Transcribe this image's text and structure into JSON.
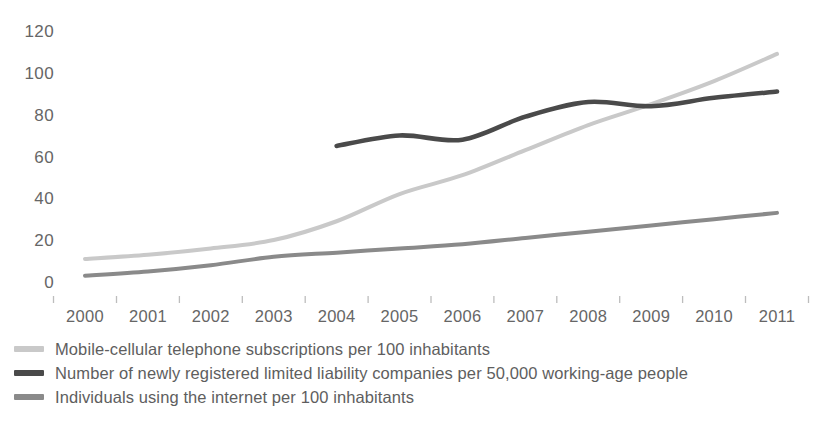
{
  "chart_data": {
    "type": "line",
    "title": "",
    "subtitle": "",
    "xlabel": "",
    "ylabel": "",
    "x": [
      2000,
      2001,
      2002,
      2003,
      2004,
      2005,
      2006,
      2007,
      2008,
      2009,
      2010,
      2011
    ],
    "categories": [
      "2000",
      "2001",
      "2002",
      "2003",
      "2004",
      "2005",
      "2006",
      "2007",
      "2008",
      "2009",
      "2010",
      "2011"
    ],
    "xlim": [
      2000,
      2011
    ],
    "ylim": [
      0,
      120
    ],
    "y_ticks": [
      0,
      20,
      40,
      60,
      80,
      100,
      120
    ],
    "y_tick_labels": [
      "0",
      "20",
      "40",
      "60",
      "80",
      "100",
      "120"
    ],
    "grid": false,
    "legend_position": "below",
    "series": [
      {
        "name": "Mobile-cellular telephone subscriptions per 100 inhabitants",
        "color": "#c9c9c9",
        "x": [
          2000,
          2001,
          2002,
          2003,
          2004,
          2005,
          2006,
          2007,
          2008,
          2009,
          2010,
          2011
        ],
        "values": [
          12,
          14,
          17,
          21,
          30,
          43,
          52,
          64,
          76,
          86,
          97,
          110
        ]
      },
      {
        "name": "Number of newly registered limited liability companies per 50,000 working-age people",
        "color": "#4a4a4a",
        "x": [
          2004,
          2005,
          2006,
          2007,
          2008,
          2009,
          2010,
          2011
        ],
        "values": [
          66,
          71,
          69,
          80,
          87,
          85,
          89,
          92
        ]
      },
      {
        "name": "Individuals using the internet per 100 inhabitants",
        "color": "#8a8a8a",
        "x": [
          2000,
          2001,
          2002,
          2003,
          2004,
          2005,
          2006,
          2007,
          2008,
          2009,
          2010,
          2011
        ],
        "values": [
          4,
          6,
          9,
          13,
          15,
          17,
          19,
          22,
          25,
          28,
          31,
          34
        ]
      }
    ]
  },
  "axes": {
    "y_labels": [
      "120",
      "100",
      "80",
      "60",
      "40",
      "20",
      "0"
    ],
    "x_labels": [
      "2000",
      "2001",
      "2002",
      "2003",
      "2004",
      "2005",
      "2006",
      "2007",
      "2008",
      "2009",
      "2010",
      "2011"
    ]
  },
  "legend": {
    "items": [
      {
        "label": "Mobile-cellular telephone subscriptions per 100 inhabitants",
        "color": "#c9c9c9",
        "swatch_name": "legend-swatch-mobile"
      },
      {
        "label": "Number of newly registered limited liability companies per 50,000 working-age people",
        "color": "#4a4a4a",
        "swatch_name": "legend-swatch-companies"
      },
      {
        "label": "Individuals using the internet per 100 inhabitants",
        "color": "#8a8a8a",
        "swatch_name": "legend-swatch-internet"
      }
    ]
  },
  "colors": {
    "mobile_line": "#c9c9c9",
    "companies_line": "#4a4a4a",
    "internet_line": "#8a8a8a",
    "tick_text": "#666666",
    "background": "#ffffff"
  }
}
